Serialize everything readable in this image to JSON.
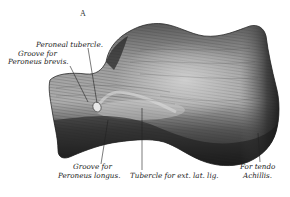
{
  "figure": {
    "letter": "A",
    "labels": {
      "peroneal_tubercle": "Peroneal tubercle.",
      "groove_brevis_line1": "Groove for",
      "groove_brevis_line2": "Peroneus brevis.",
      "groove_longus_line1": "Groove for",
      "groove_longus_line2": "Peroneus longus.",
      "tubercle_ext_lat_lig": "Tubercle for ext. lat. lig.",
      "tendo_achillis_line1": "For tendo",
      "tendo_achillis_line2": "Achillis."
    },
    "colors": {
      "background": "#ffffff",
      "bone_light": "#b8b8b8",
      "bone_mid": "#7a7a7a",
      "bone_dark": "#1e1e1e",
      "text": "#222222"
    }
  }
}
